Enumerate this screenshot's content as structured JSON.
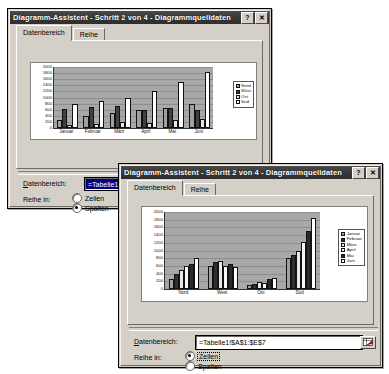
{
  "colors": {
    "title_bar": "#3a3a3a",
    "title_text": "#ffffff",
    "dialog_face": "#d4d0c8",
    "plot_area": "#a8a8a8",
    "selection_blue": "#000080",
    "series_nord": "#a0a0a0",
    "series_west": "#404040",
    "series_ost": "#f0f0f0",
    "series_sued": "#ffffff"
  },
  "window1": {
    "title": "Diagramm-Assistent - Schritt 2 von 4 - Diagrammquelldaten",
    "help_button": "?",
    "close_button": "✕",
    "tabs": [
      {
        "label": "Datenbereich",
        "selected": true
      },
      {
        "label": "Reihe",
        "selected": false
      }
    ],
    "data_range_label": "Datenbereich:",
    "data_range_value": "=Tabelle1!$A$1:$E$7",
    "series_in_label": "Reihe in:",
    "radios": [
      {
        "label": "Zeilen",
        "checked": false,
        "focused": false
      },
      {
        "label": "Spalten",
        "checked": true,
        "focused": false
      }
    ]
  },
  "window2": {
    "title": "Diagramm-Assistent - Schritt 2 von 4 - Diagrammquelldaten",
    "help_button": "?",
    "close_button": "✕",
    "tabs": [
      {
        "label": "Datenbereich",
        "selected": true
      },
      {
        "label": "Reihe",
        "selected": false
      }
    ],
    "data_range_label": "Datenbereich:",
    "data_range_value": "=Tabelle1!$A$1:$E$7",
    "range_picker_icon": "range-picker-icon",
    "series_in_label": "Reihe in:",
    "radios": [
      {
        "label": "Zeilen",
        "checked": true,
        "focused": true
      },
      {
        "label": "Spalten",
        "checked": false,
        "focused": false
      }
    ]
  },
  "chart_data": [
    {
      "id": "chart1",
      "type": "bar",
      "title": "",
      "xlabel": "",
      "ylabel": "",
      "ylim": [
        0,
        2000
      ],
      "ytick_step": 200,
      "yticks": [
        0,
        200,
        400,
        600,
        800,
        1000,
        1200,
        1400,
        1600,
        1800,
        2000
      ],
      "grid": true,
      "legend_position": "right",
      "categories": [
        "Januar",
        "Februar",
        "März",
        "April",
        "Mai",
        "Juni"
      ],
      "series": [
        {
          "name": "Nord",
          "color": "#a0a0a0",
          "values": [
            250,
            380,
            500,
            600,
            640,
            800
          ]
        },
        {
          "name": "West",
          "color": "#404040",
          "values": [
            610,
            690,
            730,
            600,
            640,
            580
          ]
        },
        {
          "name": "Ost",
          "color": "#e8e8e8",
          "values": [
            110,
            120,
            190,
            160,
            250,
            290
          ]
        },
        {
          "name": "Süd",
          "color": "#ffffff",
          "values": [
            800,
            890,
            1000,
            1210,
            1500,
            1850
          ]
        }
      ]
    },
    {
      "id": "chart2",
      "type": "bar",
      "title": "",
      "xlabel": "",
      "ylabel": "",
      "ylim": [
        0,
        2000
      ],
      "ytick_step": 200,
      "yticks": [
        0,
        200,
        400,
        600,
        800,
        1000,
        1200,
        1400,
        1600,
        1800,
        2000
      ],
      "grid": true,
      "legend_position": "right",
      "categories": [
        "Nord",
        "West",
        "Ost",
        "Süd"
      ],
      "series": [
        {
          "name": "Januar",
          "color": "#a0a0a0",
          "values": [
            250,
            610,
            110,
            800
          ]
        },
        {
          "name": "Februar",
          "color": "#303030",
          "values": [
            380,
            690,
            120,
            890
          ]
        },
        {
          "name": "März",
          "color": "#e8e8e8",
          "values": [
            500,
            730,
            190,
            1000
          ]
        },
        {
          "name": "April",
          "color": "#f6f6f6",
          "values": [
            600,
            600,
            160,
            1210
          ]
        },
        {
          "name": "Mai",
          "color": "#2a2a2a",
          "values": [
            640,
            640,
            250,
            1500
          ]
        },
        {
          "name": "Juni",
          "color": "#ffffff",
          "values": [
            800,
            580,
            290,
            1850
          ]
        }
      ]
    }
  ]
}
